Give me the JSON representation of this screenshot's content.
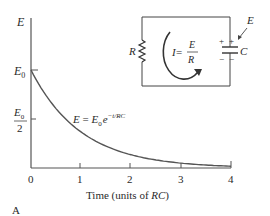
{
  "figure": {
    "panel_label": "A",
    "equation_label": {
      "lhs": "E",
      "eq": " = ",
      "base": "E",
      "sub": "0",
      "exp_base": "e",
      "exponent": "−t/RC"
    },
    "circuit": {
      "resistor_label": "R",
      "capacitor_label": "C",
      "voltage_label": "E",
      "current_lhs": "I",
      "current_eq": " = ",
      "current_num": "E",
      "current_den": "R",
      "plus": "+",
      "minus": "−"
    }
  },
  "chart_data": {
    "type": "line",
    "title": "",
    "xlabel": "Time (units of RC)",
    "xlabel_parts": {
      "prefix": "Time (units of ",
      "italic": "RC",
      "suffix": ")"
    },
    "ylabel": "E",
    "x_ticks": [
      "0",
      "1",
      "2",
      "3",
      "4"
    ],
    "y_ticks": [
      {
        "label": "E0",
        "main": "E",
        "sub": "0",
        "value": 1.0
      },
      {
        "label": "E0/2",
        "num_main": "E",
        "num_sub": "0",
        "den": "2",
        "value": 0.5
      }
    ],
    "xlim": [
      0,
      4
    ],
    "ylim": [
      0,
      1.0
    ],
    "grid": false,
    "series": [
      {
        "name": "E = E0 e^(-t/RC)",
        "x": [
          0,
          0.25,
          0.5,
          0.75,
          1.0,
          1.5,
          2.0,
          2.5,
          3.0,
          3.5,
          4.0
        ],
        "values": [
          1.0,
          0.779,
          0.607,
          0.472,
          0.368,
          0.223,
          0.135,
          0.082,
          0.05,
          0.03,
          0.018
        ]
      }
    ]
  }
}
